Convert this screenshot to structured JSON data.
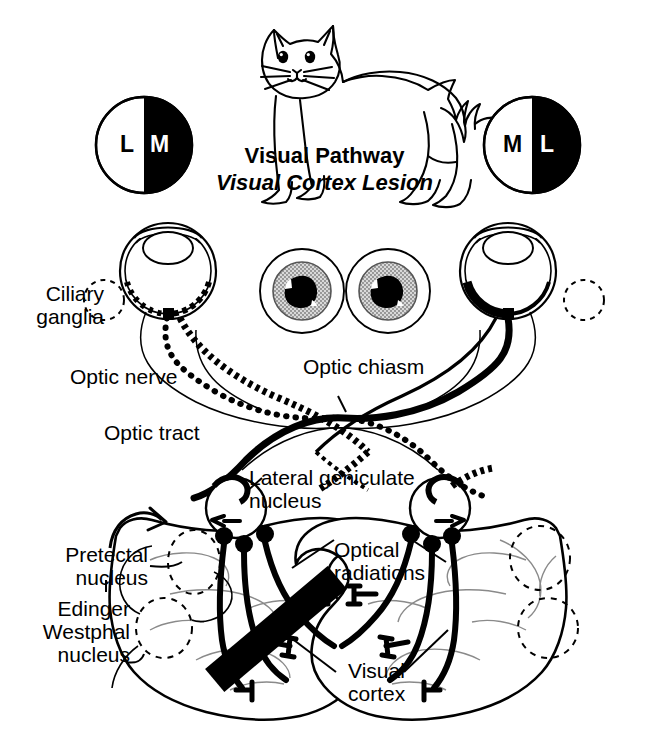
{
  "title": {
    "main": "Visual Pathway",
    "sub": "Visual Cortex Lesion"
  },
  "subject": {
    "species_icon": "cat-line-drawing"
  },
  "visual_fields": {
    "left_circle": {
      "name": "left-visual-field-hemianopia",
      "left_half_label": "L",
      "left_half_color": "#ffffff",
      "right_half_label": "M",
      "right_half_color": "#000000"
    },
    "right_circle": {
      "name": "right-visual-field-hemianopia",
      "left_half_label": "M",
      "left_half_color": "#ffffff",
      "right_half_label": "L",
      "right_half_color": "#000000"
    }
  },
  "pupils": {
    "left": {
      "state": "constricted",
      "iris_fill": "#b8b8b8",
      "pupil_fill": "#000000"
    },
    "right": {
      "state": "constricted",
      "iris_fill": "#b8b8b8",
      "pupil_fill": "#000000"
    }
  },
  "labels": {
    "ciliary_ganglia": "Ciliary\nganglia",
    "optic_nerve": "Optic nerve",
    "optic_chiasm": "Optic chiasm",
    "optic_tract": "Optic tract",
    "lateral_geniculate_nucleus": "Lateral geniculate\nnucleus",
    "optical_radiations": "Optical\nradiations",
    "pretectal_nucleus": "Pretectal\nnucleus",
    "edinger_westphal_nucleus": "Edinger\nWestphal\nnucleus",
    "visual_cortex": "Visual\ncortex"
  },
  "lesion": {
    "name": "visual-cortex-lesion-bar",
    "color": "#000000",
    "side": "left",
    "orientation": "diagonal"
  },
  "colors": {
    "ink": "#000000",
    "paper": "#ffffff",
    "iris_gray": "#b8b8b8",
    "faint_gyri": "#8a8a8a"
  }
}
